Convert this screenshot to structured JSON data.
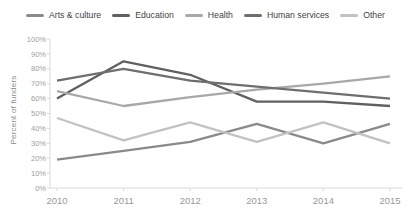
{
  "chart_data": {
    "type": "line",
    "title": "",
    "ylabel": "Percent of funders",
    "xlabel": "",
    "x": [
      "2010",
      "2011",
      "2012",
      "2013",
      "2014",
      "2015"
    ],
    "y_tick_labels": [
      "100%",
      "90%",
      "80%",
      "70%",
      "60%",
      "50%",
      "40%",
      "30%",
      "20%",
      "10%",
      "0%"
    ],
    "ylim": [
      0,
      100
    ],
    "grid": false,
    "legend_position": "top",
    "axis_color": "#d9d9d9",
    "series": [
      {
        "name": "Arts & culture",
        "color": "#8a8a8a",
        "values": [
          19,
          25,
          31,
          43,
          30,
          43
        ]
      },
      {
        "name": "Education",
        "color": "#606060",
        "values": [
          60,
          85,
          76,
          58,
          58,
          55
        ]
      },
      {
        "name": "Health",
        "color": "#a8a8a8",
        "values": [
          65,
          55,
          61,
          66,
          70,
          75
        ]
      },
      {
        "name": "Human services",
        "color": "#6f6f6f",
        "values": [
          72,
          80,
          72,
          68,
          64,
          60
        ]
      },
      {
        "name": "Other",
        "color": "#c2c2c2",
        "values": [
          47,
          32,
          44,
          31,
          44,
          30
        ]
      }
    ]
  }
}
